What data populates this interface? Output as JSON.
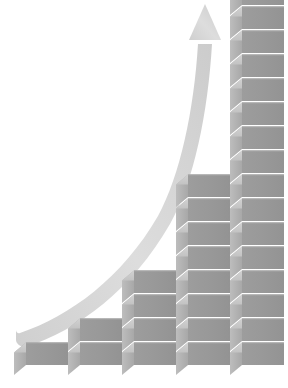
{
  "figure": {
    "background_color": "#ffffff",
    "width": 288,
    "height": 388
  },
  "colors": {
    "cube_front": "#9a9a9a",
    "cube_top": "#c9c9c9",
    "cube_left": "#b4b4b4",
    "cube_front_shadow": "#8e8e8e",
    "cube_edge": "#d8d8d8",
    "arrow": "#d2d2d2",
    "arrow_light": "#e0e0e0",
    "background": "#ffffff"
  },
  "chart_data": {
    "type": "bar",
    "subtitle": "",
    "xlabel": "",
    "ylabel": "",
    "categories": [
      "1",
      "2",
      "3",
      "4",
      "5"
    ],
    "values": [
      1,
      2,
      4,
      8,
      16
    ],
    "unit": "cubes",
    "ylim": [
      0,
      16
    ],
    "grid": false,
    "legend": null,
    "legend_position": "none",
    "tick_labels_x": [],
    "tick_labels_y": [],
    "annotations": [
      {
        "name": "growth-arrow",
        "type": "curved-arrow",
        "direction": "up-right",
        "start": [
          16,
          330
        ],
        "end": [
          205,
          8
        ],
        "description": "Curved arrow sweeping upward from lower-left to upper-right"
      }
    ],
    "series": [
      {
        "name": "cube stack count",
        "values": [
          1,
          2,
          4,
          8,
          16
        ]
      }
    ]
  },
  "bars": [
    {
      "name": "bar-1",
      "count": 1,
      "x": 14,
      "width": 54,
      "label": "1"
    },
    {
      "name": "bar-2",
      "count": 2,
      "x": 68,
      "width": 54,
      "label": "2"
    },
    {
      "name": "bar-3",
      "count": 4,
      "x": 122,
      "width": 54,
      "label": "4"
    },
    {
      "name": "bar-4",
      "count": 8,
      "x": 176,
      "width": 54,
      "label": "8"
    },
    {
      "name": "bar-5",
      "count": 16,
      "x": 230,
      "width": 54,
      "label": "16"
    }
  ],
  "geometry": {
    "baseline_y": 365,
    "cube_height": 22.5,
    "cube_face_width": 42,
    "cube_depth_x": 12,
    "cube_depth_y": 10,
    "gap": 1.5
  }
}
